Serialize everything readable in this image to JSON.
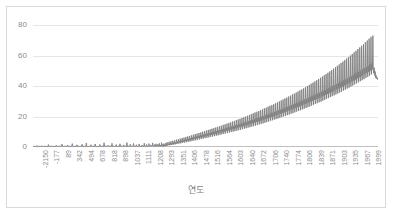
{
  "chart_data": {
    "type": "line",
    "title": "",
    "subtitle": "",
    "xlabel": "연도",
    "ylabel": "",
    "xlim": [
      -2150,
      2010
    ],
    "ylim": [
      0,
      80
    ],
    "yticks": [
      0,
      20,
      40,
      60,
      80
    ],
    "grid": true,
    "legend": false,
    "legend_position": "none",
    "line_color": "#808080",
    "gridline_color": "#e6e6e6",
    "axis_color": "#bfbfbf",
    "tick_label_color": "#8c8c8c",
    "xtick_labels": [
      "-2150",
      "-177",
      "89",
      "342",
      "494",
      "678",
      "818",
      "898",
      "1037",
      "1111",
      "1208",
      "1293",
      "1351",
      "1406",
      "1478",
      "1516",
      "1564",
      "1603",
      "1640",
      "1672",
      "1706",
      "1740",
      "1774",
      "1806",
      "1839",
      "1871",
      "1903",
      "1935",
      "1967",
      "1999"
    ],
    "ytick_labels": [
      "0",
      "20",
      "40",
      "60",
      "80"
    ],
    "series": [
      {
        "name": "series-1",
        "values": [
          0.4,
          0.3,
          0.5,
          0.4,
          0.6,
          0.4,
          0.3,
          0.5,
          0.9,
          0.4,
          0.5,
          0.3,
          0.4,
          0.6,
          0.4,
          0.5,
          0.3,
          0.4,
          0.7,
          0.4,
          0.3,
          0.5,
          0.4,
          0.3,
          0.6,
          0.4,
          0.3,
          0.4,
          0.5,
          0.3,
          0.4,
          0.3,
          0.5,
          1.6,
          0.5,
          0.4,
          0.3,
          0.5,
          0.4,
          0.6,
          0.3,
          0.4,
          0.5,
          0.3,
          0.4,
          0.5,
          0.3,
          0.4,
          0.6,
          0.4,
          1.1,
          0.5,
          0.4,
          0.3,
          0.5,
          0.4,
          0.3,
          0.6,
          0.4,
          0.5,
          0.3,
          0.4,
          1.9,
          0.6,
          0.4,
          0.3,
          0.5,
          0.4,
          0.6,
          0.3,
          0.5,
          0.4,
          0.3,
          0.5,
          1.3,
          0.4,
          0.5,
          0.3,
          0.6,
          0.4,
          0.5,
          0.3,
          0.4,
          0.6,
          2.2,
          0.5,
          0.4,
          0.3,
          0.5,
          0.4,
          0.6,
          0.4,
          0.3,
          0.5,
          1.4,
          0.4,
          0.3,
          0.5,
          0.6,
          0.4,
          0.3,
          0.5,
          0.4,
          0.6,
          0.4,
          1.8,
          0.5,
          0.3,
          0.4,
          0.6,
          0.4,
          0.5,
          0.3,
          0.4,
          2.6,
          0.5,
          0.4,
          0.3,
          0.6,
          0.4,
          0.5,
          0.3,
          0.4,
          0.6,
          1.5,
          0.4,
          0.5,
          0.3,
          0.4,
          0.6,
          0.4,
          0.3,
          0.5,
          2.0,
          0.4,
          0.5,
          0.3,
          0.6,
          0.4,
          0.5,
          0.3,
          0.4,
          0.6,
          1.7,
          0.5,
          0.4,
          0.3,
          0.5,
          0.4,
          0.6,
          0.4,
          0.3,
          2.8,
          0.5,
          0.4,
          0.6,
          0.3,
          0.5,
          0.4,
          0.3,
          0.6,
          1.2,
          0.4,
          0.5,
          0.3,
          0.4,
          0.6,
          0.4,
          0.5,
          2.4,
          0.3,
          0.4,
          0.6,
          0.5,
          0.3,
          0.4,
          0.6,
          0.4,
          1.6,
          0.5,
          0.3,
          0.4,
          0.6,
          0.5,
          0.4,
          0.3,
          2.1,
          0.5,
          0.4,
          0.6,
          0.3,
          0.5,
          0.4,
          0.6,
          1.4,
          0.4,
          0.5,
          0.3,
          0.6,
          0.4,
          0.5,
          2.9,
          0.4,
          0.3,
          0.6,
          0.5,
          0.4,
          0.3,
          1.8,
          0.5,
          0.6,
          0.4,
          0.3,
          0.5,
          0.4,
          2.3,
          0.6,
          0.4,
          0.5,
          0.3,
          0.4,
          1.5,
          0.6,
          0.5,
          0.4,
          0.3,
          0.6,
          2.0,
          0.4,
          0.5,
          0.3,
          0.6,
          0.4,
          1.3,
          0.5,
          0.6,
          0.4,
          0.3,
          2.5,
          0.5,
          0.4,
          0.6,
          0.3,
          1.7,
          0.5,
          0.4,
          0.6,
          0.4,
          2.2,
          0.5,
          0.3,
          0.6,
          1.4,
          0.5,
          0.4,
          0.6,
          2.7,
          0.4,
          0.5,
          0.3,
          1.6,
          0.6,
          0.4,
          2.1,
          0.5,
          0.4,
          0.6,
          1.8,
          0.5,
          0.4,
          2.4,
          0.6,
          0.5,
          1.3,
          0.4,
          2.9,
          0.6,
          0.5,
          1.9,
          0.4,
          2.2,
          0.6,
          1.5,
          0.5,
          2.6,
          0.7,
          1.8,
          3.1,
          0.9,
          2.0,
          1.4,
          3.4,
          1.1,
          2.3,
          1.6,
          3.8,
          1.3,
          2.6,
          1.8,
          4.1,
          1.5,
          2.9,
          2.0,
          4.4,
          1.7,
          3.2,
          2.3,
          4.8,
          2.0,
          3.5,
          2.6,
          5.1,
          2.2,
          3.8,
          2.9,
          5.5,
          2.4,
          4.1,
          3.2,
          5.9,
          2.7,
          4.4,
          3.5,
          6.2,
          2.9,
          4.8,
          3.8,
          6.6,
          3.1,
          5.1,
          4.1,
          7.0,
          3.4,
          5.4,
          4.4,
          7.3,
          3.6,
          5.8,
          4.7,
          7.7,
          3.9,
          6.1,
          5.0,
          8.1,
          4.2,
          6.4,
          5.3,
          8.4,
          4.4,
          6.8,
          5.6,
          8.8,
          4.7,
          7.1,
          5.9,
          9.2,
          5.0,
          7.4,
          6.2,
          9.6,
          5.2,
          7.8,
          6.5,
          10.0,
          5.5,
          8.1,
          6.8,
          10.4,
          5.8,
          8.5,
          7.1,
          10.8,
          6.0,
          8.8,
          7.4,
          11.2,
          6.3,
          9.1,
          7.7,
          11.6,
          6.6,
          9.5,
          8.0,
          12.0,
          6.9,
          9.8,
          8.3,
          12.4,
          7.1,
          10.2,
          8.6,
          12.8,
          7.4,
          10.5,
          9.0,
          13.2,
          7.7,
          10.9,
          9.3,
          13.6,
          8.0,
          11.2,
          9.6,
          14.0,
          8.3,
          11.6,
          9.9,
          14.5,
          8.6,
          11.9,
          10.2,
          14.9,
          8.9,
          12.3,
          10.6,
          15.3,
          9.2,
          12.7,
          10.9,
          15.8,
          9.5,
          13.0,
          11.2,
          16.2,
          9.8,
          13.4,
          11.6,
          16.7,
          10.1,
          13.8,
          11.9,
          17.1,
          10.4,
          14.2,
          12.3,
          17.6,
          10.7,
          14.5,
          12.6,
          18.1,
          11.0,
          14.9,
          13.0,
          18.5,
          11.3,
          15.3,
          13.3,
          19.0,
          11.7,
          15.7,
          13.7,
          19.5,
          12.0,
          16.1,
          14.1,
          20.0,
          12.3,
          16.5,
          14.4,
          20.5,
          12.7,
          16.9,
          14.8,
          21.0,
          13.0,
          17.3,
          15.2,
          21.5,
          13.4,
          17.7,
          15.6,
          22.0,
          13.7,
          18.1,
          16.0,
          22.6,
          14.1,
          18.6,
          16.4,
          23.1,
          14.4,
          19.0,
          16.8,
          23.6,
          14.8,
          19.4,
          17.2,
          24.2,
          15.2,
          19.8,
          17.6,
          24.7,
          15.5,
          20.3,
          18.0,
          25.3,
          15.9,
          20.7,
          18.4,
          25.8,
          16.3,
          21.2,
          18.8,
          26.4,
          16.7,
          21.6,
          19.3,
          27.0,
          17.1,
          22.1,
          19.7,
          27.5,
          17.5,
          22.5,
          20.1,
          28.1,
          17.9,
          23.0,
          20.6,
          28.7,
          18.3,
          23.5,
          21.0,
          29.3,
          18.7,
          23.9,
          21.5,
          29.9,
          19.1,
          24.4,
          21.9,
          30.5,
          19.6,
          24.9,
          22.4,
          31.2,
          20.0,
          25.4,
          22.8,
          31.8,
          20.4,
          25.9,
          23.3,
          32.4,
          20.9,
          26.4,
          23.8,
          33.1,
          21.3,
          26.9,
          24.2,
          33.7,
          21.8,
          27.4,
          24.7,
          34.4,
          22.2,
          27.9,
          25.2,
          35.0,
          22.7,
          28.4,
          25.7,
          35.7,
          23.2,
          28.9,
          26.2,
          36.4,
          23.6,
          29.5,
          26.7,
          37.1,
          24.1,
          30.0,
          27.2,
          37.8,
          24.6,
          30.5,
          27.7,
          38.5,
          25.1,
          31.1,
          28.2,
          39.2,
          25.6,
          31.6,
          28.7,
          40.0,
          26.1,
          32.2,
          29.2,
          40.7,
          26.6,
          32.7,
          29.8,
          41.5,
          27.1,
          33.3,
          30.3,
          42.2,
          27.7,
          33.9,
          30.8,
          43.0,
          28.2,
          34.4,
          31.4,
          43.8,
          28.7,
          35.0,
          31.9,
          44.6,
          29.3,
          35.6,
          32.5,
          45.4,
          29.8,
          36.2,
          33.0,
          46.2,
          30.4,
          36.8,
          33.6,
          47.0,
          30.9,
          37.4,
          34.2,
          47.9,
          31.5,
          38.0,
          34.8,
          48.7,
          32.1,
          38.6,
          35.3,
          49.6,
          32.7,
          39.2,
          35.9,
          50.5,
          33.3,
          39.9,
          36.5,
          51.4,
          33.9,
          40.5,
          37.1,
          52.3,
          34.5,
          41.1,
          37.7,
          53.2,
          35.1,
          41.8,
          38.4,
          54.1,
          35.7,
          42.4,
          39.0,
          55.1,
          36.3,
          43.1,
          39.6,
          56.0,
          37.0,
          43.8,
          40.3,
          57.0,
          37.6,
          44.4,
          40.9,
          58.0,
          38.3,
          45.1,
          41.6,
          59.0,
          38.9,
          45.8,
          42.2,
          60.0,
          39.6,
          46.5,
          42.9,
          61.0,
          40.3,
          47.2,
          43.6,
          62.1,
          41.0,
          47.9,
          44.3,
          63.1,
          41.7,
          48.7,
          45.0,
          64.2,
          42.4,
          49.4,
          45.7,
          65.3,
          43.1,
          50.1,
          46.4,
          66.4,
          43.8,
          50.9,
          47.1,
          67.5,
          44.5,
          51.7,
          47.9,
          68.7,
          45.3,
          52.4,
          48.6,
          69.8,
          46.0,
          53.2,
          49.4,
          71.0,
          46.8,
          54.0,
          50.1,
          72.2,
          47.6,
          54.8,
          50.9,
          73.0,
          50.5,
          48.3,
          52.0,
          46.8,
          49.5,
          45.2,
          47.0,
          44.8,
          45.6,
          44.2,
          45.0
        ]
      }
    ],
    "annotations": []
  }
}
